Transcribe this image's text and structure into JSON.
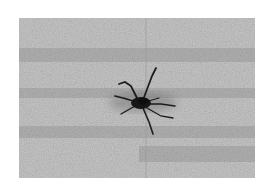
{
  "image": {
    "subject": "neuron-cell-micrograph",
    "style": "grayscale",
    "colors": {
      "background": "#ffffff",
      "field_light": "#d0d0d0",
      "field_dark": "#a8a8a8",
      "cell": "#1a1a1a"
    }
  }
}
